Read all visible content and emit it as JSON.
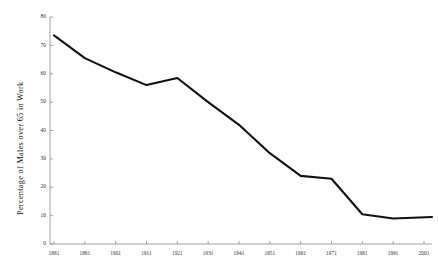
{
  "chart_data": {
    "type": "line",
    "title": "",
    "xlabel": "",
    "ylabel": "Percentage of Males over 65 in Work",
    "x": [
      1881,
      1891,
      1901,
      1911,
      1921,
      1931,
      1941,
      1951,
      1961,
      1971,
      1981,
      1991,
      2001
    ],
    "categories": [
      "1881",
      "1891",
      "1901",
      "1911",
      "1921",
      "1931",
      "1941",
      "1951",
      "1961",
      "1971",
      "1981",
      "1991",
      "2001"
    ],
    "values": [
      73.5,
      65.5,
      60.5,
      56.0,
      58.5,
      50.0,
      42.0,
      32.0,
      24.0,
      23.0,
      10.5,
      9.0,
      9.5
    ],
    "series": [
      {
        "name": "Percentage of Males over 65 in Work",
        "values": [
          73.5,
          65.5,
          60.5,
          56.0,
          58.5,
          50.0,
          42.0,
          32.0,
          24.0,
          23.0,
          10.5,
          9.0,
          9.5
        ]
      }
    ],
    "ylim": [
      0,
      80
    ],
    "yticks": [
      0,
      10,
      20,
      30,
      40,
      50,
      60,
      70,
      80
    ],
    "ytick_labels": [
      "0",
      "10",
      "20",
      "30",
      "40",
      "50",
      "60",
      "70",
      "80"
    ],
    "xtick_labels": [
      "1881",
      "1891",
      "1901",
      "1911",
      "1921",
      "1931",
      "1941",
      "1951",
      "1961",
      "1971",
      "1981",
      "1991",
      "2001"
    ],
    "grid": false,
    "legend": "none",
    "line_color": "#111111",
    "axis_color": "#8a8a8a",
    "background_color": "#ffffff"
  }
}
